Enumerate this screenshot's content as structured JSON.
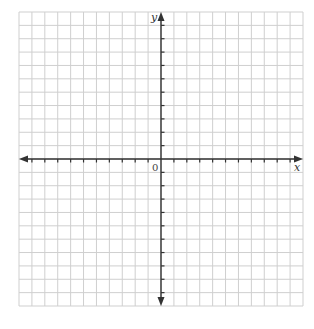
{
  "diagram": {
    "type": "coordinate-plane",
    "grid": {
      "columns": 22,
      "rows": 22,
      "x_min": 19,
      "x_max": 303,
      "y_min": 12,
      "y_max": 306
    },
    "axes": {
      "x_label": "x",
      "y_label": "y",
      "origin_label": "0",
      "origin_col": 11,
      "origin_row": 11
    },
    "colors": {
      "grid": "#cfcfcf",
      "axis": "#333333",
      "background": "#ffffff"
    }
  }
}
